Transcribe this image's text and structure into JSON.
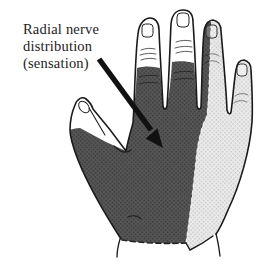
{
  "figure": {
    "type": "medical-illustration"
  },
  "label": {
    "line1": "Radial nerve",
    "line2": "distribution",
    "line3": "(sensation)",
    "full_text": "Radial nerve distribution (sensation)"
  },
  "regions": {
    "dark_region_meaning": "Radial nerve distribution (sensation)",
    "light_region_meaning": "ulnar-side shaded region",
    "white_region_meaning": "unshaded fingertips and thumb"
  },
  "colors": {
    "background": "#ffffff",
    "outline": "#1a1a1a",
    "dark_base": "#575757",
    "dark_dot": "#383838",
    "light_base": "#ececec",
    "light_dot": "#c6c6c6",
    "arrow": "#111111"
  }
}
